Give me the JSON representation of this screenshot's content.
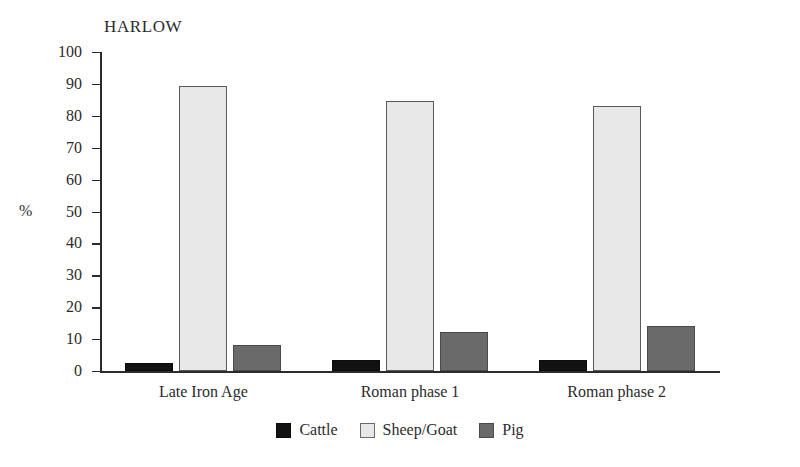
{
  "chart_data": {
    "type": "bar",
    "title": "HARLOW",
    "xlabel": "",
    "ylabel": "%",
    "ylim": [
      0,
      100
    ],
    "ytick_labels": [
      "100",
      "90",
      "80",
      "70",
      "60",
      "50",
      "40",
      "30",
      "20",
      "10",
      "0"
    ],
    "yticks": [
      100,
      90,
      80,
      70,
      60,
      50,
      40,
      30,
      20,
      10,
      0
    ],
    "grid": false,
    "legend_position": "bottom-center",
    "categories": [
      "Late Iron Age",
      "Roman phase 1",
      "Roman phase 2"
    ],
    "series": [
      {
        "name": "Cattle",
        "color": "#121212",
        "values": [
          2.5,
          3.5,
          3.5
        ]
      },
      {
        "name": "Sheep/Goat",
        "color": "#e8e8e8",
        "values": [
          89.5,
          84.5,
          83.0
        ]
      },
      {
        "name": "Pig",
        "color": "#6a6a6a",
        "values": [
          8.0,
          12.3,
          14.0
        ]
      }
    ]
  },
  "axis": {
    "y_title": "%"
  },
  "legend": {
    "items": [
      {
        "label": "Cattle",
        "swatch": "cattle"
      },
      {
        "label": "Sheep/Goat",
        "swatch": "sheepgoat"
      },
      {
        "label": "Pig",
        "swatch": "pig"
      }
    ]
  }
}
